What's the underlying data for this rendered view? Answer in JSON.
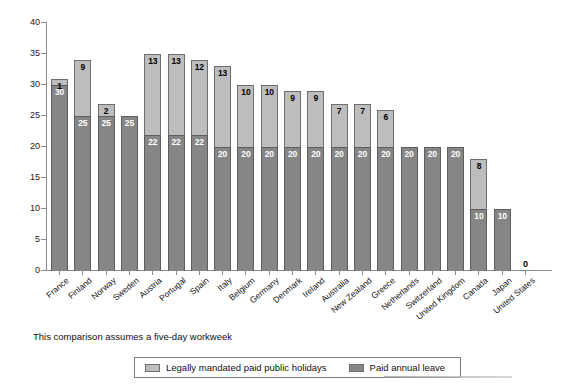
{
  "chart_data": {
    "type": "bar",
    "stacked": true,
    "title": "",
    "subtitle": "",
    "xlabel": "",
    "ylabel": "",
    "ylim": [
      0,
      40
    ],
    "ytick_step": 5,
    "yticks": [
      0,
      5,
      10,
      15,
      20,
      25,
      30,
      35,
      40
    ],
    "grid": false,
    "legend_position": "bottom",
    "categories": [
      "France",
      "Finland",
      "Norway",
      "Sweden",
      "Austria",
      "Portugal",
      "Spain",
      "Italy",
      "Belgium",
      "Germany",
      "Denmark",
      "Ireland",
      "Australia",
      "New Zealand",
      "Greece",
      "Netherlands",
      "Switzerland",
      "United Kingdom",
      "Canada",
      "Japan",
      "United States"
    ],
    "series": [
      {
        "name": "Paid annual leave",
        "color": "#868686",
        "values": [
          30,
          25,
          25,
          25,
          22,
          22,
          22,
          20,
          20,
          20,
          20,
          20,
          20,
          20,
          20,
          20,
          20,
          20,
          10,
          10,
          0
        ]
      },
      {
        "name": "Legally mandated paid public holidays",
        "color": "#bdbdbd",
        "values": [
          1,
          9,
          2,
          0,
          13,
          13,
          12,
          13,
          10,
          10,
          9,
          9,
          7,
          7,
          6,
          0,
          0,
          0,
          8,
          0,
          0
        ]
      }
    ],
    "totals": [
      31,
      34,
      27,
      25,
      35,
      35,
      34,
      33,
      30,
      30,
      29,
      29,
      27,
      27,
      26,
      20,
      20,
      20,
      18,
      10,
      0
    ],
    "annotations": [
      "This comparison assumes a five-day workweek"
    ],
    "zero_bar_label": "0"
  },
  "footnote": {
    "text": "This comparison assumes a five-day workweek"
  },
  "legend": {
    "items": [
      {
        "label": "Legally mandated paid public holidays",
        "color": "#bdbdbd"
      },
      {
        "label": "Paid annual leave",
        "color": "#868686"
      }
    ]
  }
}
